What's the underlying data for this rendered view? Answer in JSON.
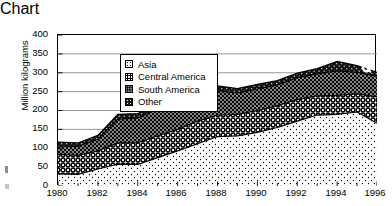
{
  "chart_data": {
    "type": "area",
    "title": "",
    "xlabel": "Year",
    "ylabel": "Million kilograms",
    "xlim": [
      1980,
      1996
    ],
    "ylim": [
      0,
      400
    ],
    "ytick_labels": [
      "0",
      "50",
      "100",
      "150",
      "200",
      "250",
      "300",
      "350",
      "400"
    ],
    "yticks": [
      0,
      50,
      100,
      150,
      200,
      250,
      300,
      350,
      400
    ],
    "xtick_labels": [
      "1980",
      "1982",
      "1984",
      "1986",
      "1988",
      "1990",
      "1992",
      "1994",
      "1996"
    ],
    "xticks": [
      1980,
      1982,
      1984,
      1986,
      1988,
      1990,
      1992,
      1994,
      1996
    ],
    "minor_xticks": true,
    "grid": "horizontal",
    "stacked": true,
    "legend_position": "upper-left inside",
    "x": [
      1980,
      1981,
      1982,
      1983,
      1984,
      1985,
      1986,
      1987,
      1988,
      1989,
      1990,
      1991,
      1992,
      1993,
      1994,
      1995,
      1996
    ],
    "series": [
      {
        "name": "Asia",
        "pattern": "light-dot",
        "values": [
          32,
          31,
          45,
          58,
          57,
          75,
          93,
          112,
          131,
          133,
          142,
          155,
          172,
          188,
          190,
          196,
          166
        ]
      },
      {
        "name": "Central America",
        "pattern": "open-circle",
        "values": [
          52,
          50,
          48,
          56,
          58,
          58,
          57,
          60,
          57,
          57,
          58,
          58,
          57,
          51,
          50,
          48,
          70
        ]
      },
      {
        "name": "South America",
        "pattern": "dark-dot",
        "values": [
          22,
          24,
          31,
          63,
          65,
          72,
          83,
          76,
          65,
          56,
          57,
          55,
          58,
          58,
          65,
          57,
          55
        ]
      },
      {
        "name": "Other",
        "pattern": "solid-black",
        "values": [
          10,
          9,
          10,
          13,
          12,
          12,
          13,
          13,
          12,
          12,
          12,
          11,
          12,
          14,
          25,
          18,
          10
        ]
      }
    ],
    "totals": [
      116,
      114,
      134,
      190,
      192,
      217,
      246,
      261,
      265,
      258,
      269,
      279,
      299,
      311,
      330,
      319,
      301
    ],
    "marks": [
      {
        "name": "white-circle-artifact",
        "x": 1995.3,
        "y": 316
      }
    ]
  }
}
